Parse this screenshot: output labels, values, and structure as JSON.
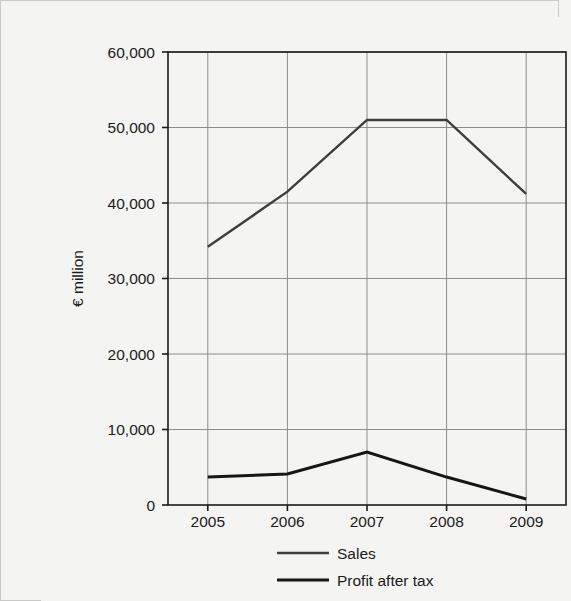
{
  "chart_data": {
    "type": "line",
    "title": "",
    "xlabel": "",
    "ylabel": "€ million",
    "categories": [
      "2005",
      "2006",
      "2007",
      "2008",
      "2009"
    ],
    "x": [
      2005,
      2006,
      2007,
      2008,
      2009
    ],
    "series": [
      {
        "name": "Sales",
        "values": [
          34200,
          41500,
          51000,
          51000,
          41200
        ],
        "color": "#3d3d3d",
        "line_width": 2.4
      },
      {
        "name": "Profit after tax",
        "values": [
          3700,
          4100,
          7000,
          3700,
          800
        ],
        "color": "#161616",
        "line_width": 3.0
      }
    ],
    "ylim": [
      0,
      60000
    ],
    "yticks": [
      0,
      10000,
      20000,
      30000,
      40000,
      50000,
      60000
    ],
    "ytick_labels": [
      "0",
      "10,000",
      "20,000",
      "30,000",
      "40,000",
      "50,000",
      "60,000"
    ],
    "xtick_labels": [
      "2005",
      "2006",
      "2007",
      "2008",
      "2009"
    ],
    "grid": true,
    "grid_color": "#8c8c8c",
    "legend_position": "bottom",
    "legend": [
      {
        "label": "Sales",
        "color": "#3d3d3d",
        "line_width": 2.4
      },
      {
        "label": "Profit after tax",
        "color": "#161616",
        "line_width": 3.0
      }
    ],
    "axis_color": "#1b1b1b",
    "background_color": "#f4f4f2"
  }
}
